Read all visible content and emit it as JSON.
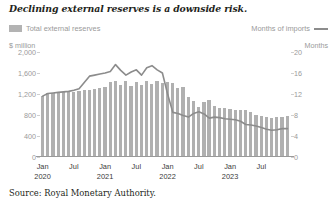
{
  "title": "Declining external reserves is a downside risk.",
  "source": "Source: Royal Monetary Authority.",
  "legend": {
    "bar_label": "Total external reserves",
    "line_label": "Months of imports",
    "bar_color": "#b0b0b0",
    "line_color": "#8c8c8c"
  },
  "axes": {
    "left_unit": "$ million",
    "right_unit": "Months"
  },
  "chart_data": {
    "type": "bar",
    "title": "Declining external reserves is a downside risk.",
    "xlabel": "",
    "ylabel": "$ million",
    "y2label": "Months",
    "ylim": [
      0,
      2000
    ],
    "y2lim": [
      0,
      20
    ],
    "grid": false,
    "legend_position": "top",
    "left_ticks": [
      "2,000",
      "1,600",
      "1,200",
      "800",
      "400",
      "0"
    ],
    "left_tick_values": [
      2000,
      1600,
      1200,
      800,
      400,
      0
    ],
    "right_ticks": [
      "20",
      "16",
      "12",
      "8",
      "4",
      "0"
    ],
    "right_tick_values": [
      20,
      16,
      12,
      8,
      4,
      0
    ],
    "tick_labels": [
      {
        "label": "Jan",
        "year": "2020",
        "index": 0
      },
      {
        "label": "Jul",
        "year": "",
        "index": 6
      },
      {
        "label": "Jan",
        "year": "2021",
        "index": 12
      },
      {
        "label": "Jul",
        "year": "",
        "index": 18
      },
      {
        "label": "Jan",
        "year": "2022",
        "index": 24
      },
      {
        "label": "Jul",
        "year": "",
        "index": 30
      },
      {
        "label": "Jan",
        "year": "2023",
        "index": 36
      },
      {
        "label": "Jul",
        "year": "",
        "index": 42
      }
    ],
    "categories": [
      "Jan 2020",
      "Feb 2020",
      "Mar 2020",
      "Apr 2020",
      "May 2020",
      "Jun 2020",
      "Jul 2020",
      "Aug 2020",
      "Sep 2020",
      "Oct 2020",
      "Nov 2020",
      "Dec 2020",
      "Jan 2021",
      "Feb 2021",
      "Mar 2021",
      "Apr 2021",
      "May 2021",
      "Jun 2021",
      "Jul 2021",
      "Aug 2021",
      "Sep 2021",
      "Oct 2021",
      "Nov 2021",
      "Dec 2021",
      "Jan 2022",
      "Feb 2022",
      "Mar 2022",
      "Apr 2022",
      "May 2022",
      "Jun 2022",
      "Jul 2022",
      "Aug 2022",
      "Sep 2022",
      "Oct 2022",
      "Nov 2022",
      "Dec 2022",
      "Jan 2023",
      "Feb 2023",
      "Mar 2023",
      "Apr 2023",
      "May 2023",
      "Jun 2023",
      "Jul 2023",
      "Aug 2023",
      "Sep 2023",
      "Oct 2023",
      "Nov 2023",
      "Dec 2023"
    ],
    "series": [
      {
        "name": "Total external reserves",
        "type": "bar",
        "axis": "left",
        "unit": "$ million",
        "color": "#b0b0b0",
        "values": [
          1160,
          1215,
          1225,
          1225,
          1230,
          1235,
          1245,
          1265,
          1275,
          1285,
          1300,
          1320,
          1330,
          1425,
          1440,
          1365,
          1445,
          1360,
          1430,
          1370,
          1440,
          1400,
          1450,
          1415,
          1430,
          1405,
          1310,
          1340,
          1150,
          1075,
          960,
          1040,
          1090,
          965,
          940,
          930,
          920,
          905,
          905,
          900,
          860,
          800,
          790,
          760,
          745,
          760,
          765,
          790
        ]
      },
      {
        "name": "Months of imports",
        "type": "line",
        "axis": "right",
        "unit": "Months",
        "color": "#8c8c8c",
        "values": [
          11.6,
          12.1,
          12.2,
          12.3,
          12.4,
          12.5,
          12.7,
          13.0,
          14.2,
          15.4,
          15.6,
          15.8,
          16.0,
          16.3,
          17.6,
          16.5,
          15.6,
          16.2,
          16.6,
          15.6,
          17.0,
          17.4,
          16.6,
          16.0,
          12.0,
          8.5,
          8.3,
          7.9,
          7.6,
          8.3,
          8.6,
          8.2,
          7.4,
          7.6,
          7.5,
          7.3,
          7.2,
          7.1,
          6.8,
          6.2,
          6.1,
          5.9,
          5.6,
          5.3,
          5.1,
          5.2,
          5.4,
          5.4
        ]
      }
    ]
  }
}
